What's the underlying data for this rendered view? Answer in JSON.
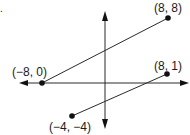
{
  "figure": {
    "type": "coordinate-plane",
    "corner_mark": ".",
    "points": [
      {
        "id": "p1",
        "label": "(8, 8)",
        "x": 8,
        "y": 8
      },
      {
        "id": "p2",
        "label": "(8, 1)",
        "x": 8,
        "y": 1
      },
      {
        "id": "p3",
        "label": "(−8, 0)",
        "x": -8,
        "y": 0
      },
      {
        "id": "p4",
        "label": "(−4, −4)",
        "x": -4,
        "y": -4
      }
    ],
    "segments": [
      {
        "from": "(−8, 0)",
        "to": "(8, 8)"
      },
      {
        "from": "(−4, −4)",
        "to": "(8, 1)"
      }
    ],
    "colors": {
      "line": "#2a2a2a",
      "point": "#111111",
      "text": "#1a1a1a",
      "background": "#ffffff"
    }
  }
}
